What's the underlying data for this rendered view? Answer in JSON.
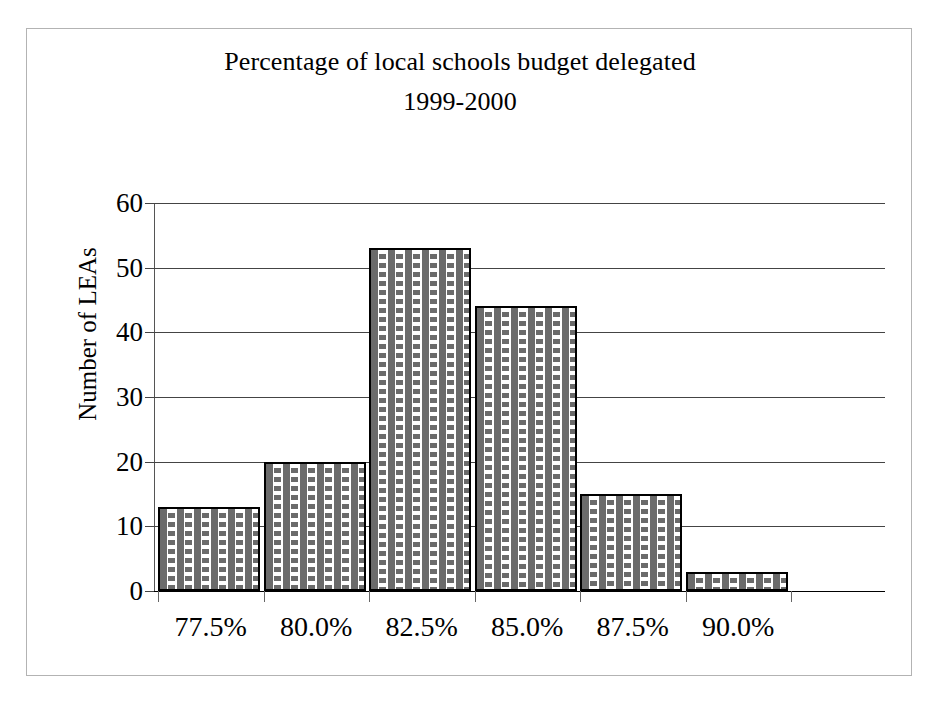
{
  "chart_data": {
    "type": "bar",
    "title": "Percentage of local schools budget delegated",
    "subtitle": "1999-2000",
    "xlabel": "",
    "ylabel": "Number of LEAs",
    "categories": [
      "77.5%",
      "80.0%",
      "82.5%",
      "85.0%",
      "87.5%",
      "90.0%"
    ],
    "values": [
      13,
      20,
      53,
      44,
      15,
      3
    ],
    "ylim": [
      0,
      60
    ],
    "ytick_labels": [
      "0",
      "10",
      "20",
      "30",
      "40",
      "50",
      "60"
    ],
    "ytick_values": [
      0,
      10,
      20,
      30,
      40,
      50,
      60
    ],
    "grid": "horizontal",
    "legend": "none",
    "bar_fill": "dashed-hatch",
    "bar_edge_color": "#000000",
    "bar_fill_color": "#6b6b6b",
    "gridline_color": "#444444",
    "background": "#ffffff",
    "frame_color": "#b3b3b3"
  }
}
